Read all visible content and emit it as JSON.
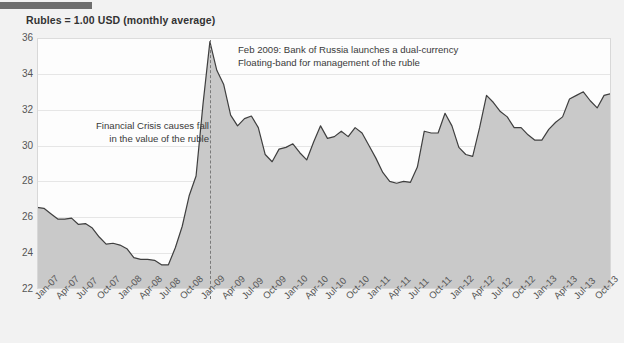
{
  "title": "Rubles = 1.00 USD (monthly average)",
  "decor": {
    "top_bar": "header-rule"
  },
  "annotations": [
    {
      "name": "annotation-financial-crisis",
      "lines": [
        "Financial Crisis causes fall",
        "in the value of the ruble"
      ],
      "align": "right",
      "x": 209,
      "y": 120
    },
    {
      "name": "annotation-bank-of-russia",
      "lines": [
        "Feb 2009: Bank of Russia launches a dual-currency",
        "Floating-band for management of the ruble"
      ],
      "align": "left",
      "x": 238,
      "y": 44
    }
  ],
  "marker_line": {
    "label": "Feb 2009",
    "x_index": 25,
    "color": "#7a7a7a"
  },
  "colors": {
    "area_fill": "#c9c9c9",
    "line": "#3f3f3f",
    "plot_background": "#fdfdfd",
    "page_background": "#f2f2f2",
    "gridline": "#e6e6e6",
    "text": "#555555",
    "top_bar": "#6e6e6e"
  },
  "chart_data": {
    "type": "area",
    "title": "Rubles = 1.00 USD (monthly average)",
    "xlabel": "",
    "ylabel": "",
    "ylim": [
      22,
      36
    ],
    "yticks": [
      22,
      24,
      26,
      28,
      30,
      32,
      34,
      36
    ],
    "grid": true,
    "legend": "none",
    "xtick_labels": [
      "Jan-07",
      "Apr-07",
      "Jul-07",
      "Oct-07",
      "Jan-08",
      "Apr-08",
      "Jul-08",
      "Oct-08",
      "Jan-09",
      "Apr-09",
      "Jul-09",
      "Oct-09",
      "Jan-10",
      "Apr-10",
      "Jul-10",
      "Oct-10",
      "Jan-11",
      "Apr-11",
      "Jul-11",
      "Oct-11",
      "Jan-12",
      "Apr-12",
      "Jul-12",
      "Oct-12",
      "Jan-13",
      "Apr-13",
      "Jul-13",
      "Oct-13"
    ],
    "x_months": [
      "Jan-07",
      "Feb-07",
      "Mar-07",
      "Apr-07",
      "May-07",
      "Jun-07",
      "Jul-07",
      "Aug-07",
      "Sep-07",
      "Oct-07",
      "Nov-07",
      "Dec-07",
      "Jan-08",
      "Feb-08",
      "Mar-08",
      "Apr-08",
      "May-08",
      "Jun-08",
      "Jul-08",
      "Aug-08",
      "Sep-08",
      "Oct-08",
      "Nov-08",
      "Dec-08",
      "Jan-09",
      "Feb-09",
      "Mar-09",
      "Apr-09",
      "May-09",
      "Jun-09",
      "Jul-09",
      "Aug-09",
      "Sep-09",
      "Oct-09",
      "Nov-09",
      "Dec-09",
      "Jan-10",
      "Feb-10",
      "Mar-10",
      "Apr-10",
      "May-10",
      "Jun-10",
      "Jul-10",
      "Aug-10",
      "Sep-10",
      "Oct-10",
      "Nov-10",
      "Dec-10",
      "Jan-11",
      "Feb-11",
      "Mar-11",
      "Apr-11",
      "May-11",
      "Jun-11",
      "Jul-11",
      "Aug-11",
      "Sep-11",
      "Oct-11",
      "Nov-11",
      "Dec-11",
      "Jan-12",
      "Feb-12",
      "Mar-12",
      "Apr-12",
      "May-12",
      "Jun-12",
      "Jul-12",
      "Aug-12",
      "Sep-12",
      "Oct-12",
      "Nov-12",
      "Dec-12",
      "Jan-13",
      "Feb-13",
      "Mar-13",
      "Apr-13",
      "May-13",
      "Jun-13",
      "Jul-13",
      "Aug-13",
      "Sep-13",
      "Oct-13",
      "Nov-13",
      "Dec-13"
    ],
    "series": [
      {
        "name": "Rubles per USD",
        "values": [
          26.55,
          26.5,
          26.2,
          25.9,
          25.9,
          25.95,
          25.6,
          25.65,
          25.4,
          24.9,
          24.5,
          24.55,
          24.45,
          24.25,
          23.75,
          23.65,
          23.65,
          23.6,
          23.35,
          23.35,
          24.3,
          25.5,
          27.2,
          28.3,
          32.3,
          35.8,
          34.2,
          33.4,
          31.7,
          31.1,
          31.5,
          31.65,
          31.0,
          29.5,
          29.1,
          29.8,
          29.9,
          30.1,
          29.6,
          29.2,
          30.2,
          31.1,
          30.4,
          30.5,
          30.8,
          30.5,
          31.0,
          30.7,
          30.0,
          29.3,
          28.5,
          28.0,
          27.9,
          28.0,
          27.95,
          28.8,
          30.8,
          30.7,
          30.7,
          31.8,
          31.1,
          29.9,
          29.5,
          29.4,
          31.0,
          32.8,
          32.4,
          31.9,
          31.6,
          31.0,
          31.0,
          30.6,
          30.3,
          30.3,
          30.9,
          31.3,
          31.6,
          32.6,
          32.8,
          33.0,
          32.5,
          32.1,
          32.8,
          32.9
        ]
      }
    ]
  }
}
